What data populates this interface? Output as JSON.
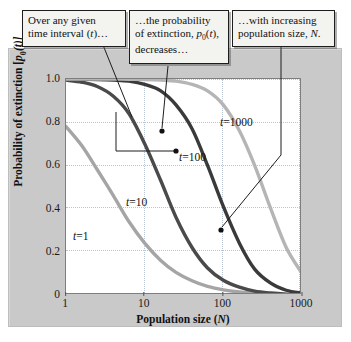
{
  "chart_data": {
    "type": "line",
    "title": "",
    "xlabel": "Population size (N)",
    "ylabel": "Probability of extinction [p0(t)]",
    "xscale": "log",
    "xlim": [
      1,
      1000
    ],
    "ylim": [
      0,
      1.0
    ],
    "xticks": [
      "1",
      "10",
      "100",
      "1000"
    ],
    "yticks": [
      "0",
      "0.2",
      "0.4",
      "0.6",
      "0.8",
      "1.0"
    ],
    "grid": true,
    "legend_position": "inline-curve-labels",
    "series": [
      {
        "name": "t=1",
        "label": "t=1",
        "color": "#a5a5a5",
        "x": [
          1,
          1.6,
          2.5,
          4,
          6.3,
          10,
          16,
          25,
          40,
          63,
          100,
          160,
          250,
          400,
          630,
          1000
        ],
        "y": [
          0.78,
          0.69,
          0.58,
          0.46,
          0.34,
          0.24,
          0.16,
          0.105,
          0.066,
          0.04,
          0.024,
          0.014,
          0.008,
          0.004,
          0.002,
          0.001
        ]
      },
      {
        "name": "t=10",
        "label": "t=10",
        "color": "#4a4a4a",
        "x": [
          1,
          1.6,
          2.5,
          4,
          6.3,
          10,
          16,
          25,
          40,
          63,
          100,
          160,
          250,
          400,
          630,
          1000
        ],
        "y": [
          0.995,
          0.985,
          0.965,
          0.92,
          0.84,
          0.7,
          0.53,
          0.36,
          0.22,
          0.125,
          0.068,
          0.036,
          0.018,
          0.009,
          0.004,
          0.002
        ]
      },
      {
        "name": "t=100",
        "label": "t=100",
        "color": "#3a3a3a",
        "x": [
          1,
          1.6,
          2.5,
          4,
          6.3,
          10,
          16,
          25,
          40,
          63,
          100,
          160,
          250,
          400,
          630,
          1000
        ],
        "y": [
          1.0,
          0.999,
          0.998,
          0.995,
          0.99,
          0.975,
          0.945,
          0.88,
          0.77,
          0.6,
          0.41,
          0.24,
          0.12,
          0.055,
          0.022,
          0.009
        ]
      },
      {
        "name": "t=1000",
        "label": "t=1000",
        "color": "#b5b5b5",
        "x": [
          1,
          1.6,
          2.5,
          4,
          6.3,
          10,
          16,
          25,
          40,
          63,
          100,
          160,
          250,
          400,
          630,
          1000
        ],
        "y": [
          1.0,
          1.0,
          1.0,
          1.0,
          0.999,
          0.998,
          0.995,
          0.99,
          0.975,
          0.945,
          0.88,
          0.76,
          0.6,
          0.4,
          0.22,
          0.1
        ]
      }
    ],
    "annotations": [
      "Over any given time interval (t)…",
      "…the probability of extinction, p0(t), decreases…",
      "…with increasing population size, N."
    ]
  },
  "axes": {
    "ylabel_prefix": "Probability of extinction [",
    "ylabel_p": "p",
    "ylabel_sub": "0",
    "ylabel_suffix": "(t)]",
    "xlabel_prefix": "Population size (",
    "xlabel_var": "N",
    "xlabel_suffix": ")",
    "yticks": [
      "1.0",
      "0.8",
      "0.6",
      "0.4",
      "0.2",
      "0"
    ],
    "xticks": [
      "1",
      "10",
      "100",
      "1000"
    ]
  },
  "curve_labels": [
    {
      "var": "t",
      "value": "=1000"
    },
    {
      "var": "t",
      "value": "=100"
    },
    {
      "var": "t",
      "value": "=10"
    },
    {
      "var": "t",
      "value": "=1"
    }
  ],
  "callouts": [
    {
      "id": "callout-time-interval",
      "line1": "Over any given",
      "line2_prefix": "time interval (",
      "line2_var": "t",
      "line2_suffix": ")…"
    },
    {
      "id": "callout-probability",
      "line1": "…the probability",
      "line2_prefix": "of extinction, ",
      "line2_p": "p",
      "line2_sub": "0",
      "line2_var": "t",
      "line2_suffix": "),",
      "line3": "decreases…"
    },
    {
      "id": "callout-population-size",
      "line1": "…with increasing",
      "line2_prefix": "population size, ",
      "line2_var": "N",
      "line2_suffix": "."
    }
  ],
  "colors": {
    "panel_bg": "#c9c9c9",
    "plot_bg": "#ffffff",
    "grid": "#b9c4d4",
    "callout_bg": "#f3f3f0",
    "callout_border": "#1d1d1d",
    "curve_t1": "#a5a5a5",
    "curve_t10": "#4a4a4a",
    "curve_t100": "#3a3a3a",
    "curve_t1000": "#b5b5b5"
  }
}
